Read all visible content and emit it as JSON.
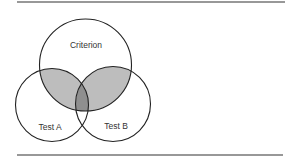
{
  "diagram": {
    "type": "venn",
    "sets": [
      {
        "id": "criterion",
        "label": "Criterion",
        "cx": 85.5,
        "cy": 65,
        "r": 46,
        "label_x": 86,
        "label_y": 48
      },
      {
        "id": "test_a",
        "label": "Test A",
        "cx": 52,
        "cy": 105,
        "r": 36.5,
        "label_x": 50,
        "label_y": 130
      },
      {
        "id": "test_b",
        "label": "Test B",
        "cx": 113,
        "cy": 104,
        "r": 37.5,
        "label_x": 116,
        "label_y": 129
      }
    ],
    "shaded_regions": [
      {
        "name": "criterion-and-test-a",
        "color": "#bdbdbd"
      },
      {
        "name": "criterion-and-test-b",
        "color": "#bdbdbd"
      },
      {
        "name": "criterion-and-test-a-and-test-b",
        "color": "#8f8f8f"
      }
    ],
    "stroke_color": "#222222",
    "rules": {
      "top_y": 2,
      "bottom_y": 155,
      "x1": 17,
      "x2": 285,
      "color": "#333333"
    }
  }
}
